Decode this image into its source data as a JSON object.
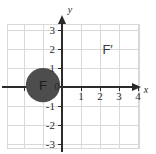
{
  "chart_data": {
    "type": "scatter",
    "title": "",
    "xlabel": "x",
    "ylabel": "y",
    "xlim": [
      -2.9,
      4.05
    ],
    "ylim": [
      -3.6,
      3.6
    ],
    "grid": true,
    "legend": null,
    "x_ticks": [
      {
        "value": 0,
        "label": "0"
      },
      {
        "value": 1,
        "label": "1"
      },
      {
        "value": 2,
        "label": "2"
      },
      {
        "value": 3,
        "label": "3"
      },
      {
        "value": 4,
        "label": "4"
      }
    ],
    "y_ticks": [
      {
        "value": 3,
        "label": "3"
      },
      {
        "value": 2,
        "label": "2"
      },
      {
        "value": 1,
        "label": "1"
      },
      {
        "value": -1,
        "label": "-1"
      },
      {
        "value": -2,
        "label": "-2"
      },
      {
        "value": -3,
        "label": "-3"
      }
    ],
    "annotations": [
      {
        "name": "figure-F",
        "label": "F",
        "shape": "filled-circle",
        "center_x": -1.0,
        "center_y": 0.1,
        "radius": 0.9,
        "fill": "#4d4d4d",
        "label_color": "#1c1c1c"
      },
      {
        "name": "figure-F-prime",
        "label": "F′",
        "shape": "text",
        "center_x": 2.4,
        "center_y": 1.95,
        "label_color": "#3a3a3a"
      }
    ],
    "colors": {
      "grid": "#d9d9d9",
      "axis": "#2b2b2b",
      "background": "#ffffff",
      "shape_fill": "#4d4d4d"
    }
  },
  "axes": {
    "x_axis_name": "x",
    "y_axis_name": "y"
  }
}
